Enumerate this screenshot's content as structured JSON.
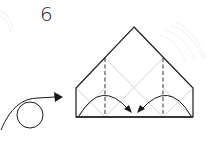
{
  "diagram": {
    "type": "origami-instruction-step",
    "step_number": "6",
    "colors": {
      "outline": "#1a1a1a",
      "crease": "#c8c8c8",
      "watermark": "#f2f2f2",
      "background": "#ffffff"
    },
    "elements": {
      "paper_shape": "pentagon (house shape)",
      "valley_folds": [
        "left vertical dashed line",
        "right vertical dashed line"
      ],
      "fold_arrows": [
        "left flap folds to center",
        "right flap folds to center"
      ],
      "turn_over_symbol": "loop arrow"
    }
  }
}
